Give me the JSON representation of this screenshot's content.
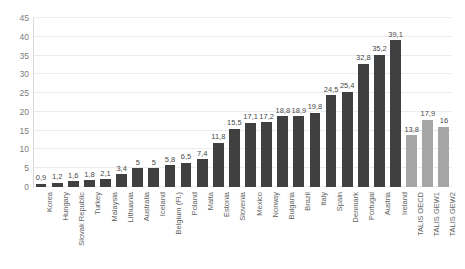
{
  "chart_data": {
    "type": "bar",
    "title": "",
    "subtitle": "",
    "xlabel": "",
    "ylabel": "",
    "ylim": [
      0,
      45
    ],
    "ytick_step": 5,
    "yticks": [
      "45",
      "40",
      "35",
      "30",
      "25",
      "20",
      "15",
      "10",
      "5",
      "0"
    ],
    "grid": true,
    "legend": "none",
    "decimal_separator": ",",
    "colors": {
      "bar_dark": "#404040",
      "bar_light": "#a6a6a6",
      "gridline": "#ececec",
      "axis": "#d9d9d9",
      "tick_text": "#7c7c7c",
      "label_text": "#5f5f5f",
      "value_text": "#4a4a4a",
      "background": "#ffffff"
    },
    "categories": [
      "Korea",
      "Hungary",
      "Slovak Republic",
      "Turkey",
      "Malaysia",
      "Lithuania",
      "Australia",
      "Iceland",
      "Belgium (Fl.)",
      "Poland",
      "Malta",
      "Estonia",
      "Slovenia",
      "Mexico",
      "Norway",
      "Bulgaria",
      "Brazil",
      "Italy",
      "Spain",
      "Denmark",
      "Portugal",
      "Austria",
      "Ireland",
      "TALIS OECD",
      "TALIS GEW1",
      "TALIS GEW2"
    ],
    "values": [
      0.9,
      1.2,
      1.6,
      1.8,
      2.1,
      3.4,
      5,
      5,
      5.8,
      6.5,
      7.4,
      11.8,
      15.5,
      17.1,
      17.2,
      18.8,
      18.9,
      19.8,
      24.5,
      25.4,
      32.8,
      35.2,
      39.1,
      13.8,
      17.9,
      16
    ],
    "value_labels": [
      "0,9",
      "1,2",
      "1,6",
      "1,8",
      "2,1",
      "3,4",
      "5",
      "5",
      "5,8",
      "6,5",
      "7,4",
      "11,8",
      "15,5",
      "17,1",
      "17,2",
      "18,8",
      "18,9",
      "19,8",
      "24,5",
      "25,4",
      "32,8",
      "35,2",
      "39,1",
      "13,8",
      "17,9",
      "16"
    ],
    "series_groups": [
      {
        "name": "countries",
        "color": "#404040",
        "start_index": 0,
        "end_index": 22
      },
      {
        "name": "talis-averages",
        "color": "#a6a6a6",
        "start_index": 23,
        "end_index": 25
      }
    ]
  }
}
